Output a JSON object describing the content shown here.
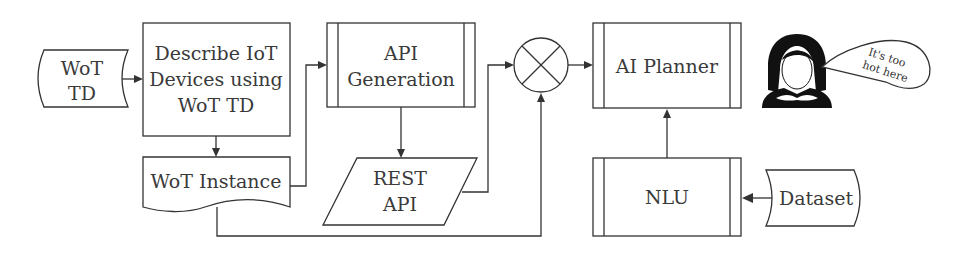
{
  "diagram": {
    "nodes": {
      "wot_td": {
        "lines": [
          "WoT",
          "TD"
        ],
        "shape": "stored-data"
      },
      "describe": {
        "lines": [
          "Describe IoT",
          "Devices using",
          "WoT TD"
        ],
        "shape": "process"
      },
      "wot_instance": {
        "lines": [
          "WoT Instance"
        ],
        "shape": "document"
      },
      "api_generation": {
        "lines": [
          "API",
          "Generation"
        ],
        "shape": "predefined-process"
      },
      "rest_api": {
        "lines": [
          "REST",
          "API"
        ],
        "shape": "data-io"
      },
      "merge": {
        "shape": "summing-junction"
      },
      "ai_planner": {
        "lines": [
          "AI Planner"
        ],
        "shape": "predefined-process"
      },
      "nlu": {
        "lines": [
          "NLU"
        ],
        "shape": "predefined-process"
      },
      "dataset": {
        "lines": [
          "Dataset"
        ],
        "shape": "stored-data"
      },
      "user": {
        "icon": "woman-user-icon"
      },
      "speech": {
        "lines": [
          "It's too",
          "hot here"
        ]
      }
    },
    "edges": [
      {
        "from": "wot_td",
        "to": "describe"
      },
      {
        "from": "describe",
        "to": "wot_instance"
      },
      {
        "from": "wot_instance",
        "to": "api_generation"
      },
      {
        "from": "api_generation",
        "to": "rest_api"
      },
      {
        "from": "rest_api",
        "to": "merge"
      },
      {
        "from": "wot_instance",
        "to": "merge"
      },
      {
        "from": "merge",
        "to": "ai_planner"
      },
      {
        "from": "nlu",
        "to": "ai_planner"
      },
      {
        "from": "dataset",
        "to": "nlu"
      }
    ]
  }
}
